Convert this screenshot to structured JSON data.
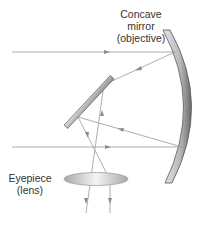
{
  "labels": {
    "concave_mirror": [
      "Concave",
      "mirror",
      "(objective)"
    ],
    "eyepiece": [
      "Eyepiece",
      "(lens)"
    ]
  },
  "colors": {
    "ray": "#9a9a9a",
    "mirror_dark": "#5a5a5a",
    "mirror_light": "#d8d8d8",
    "text": "#333333"
  }
}
